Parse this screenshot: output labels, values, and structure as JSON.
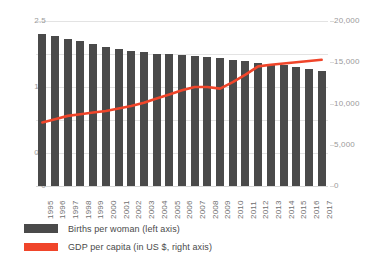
{
  "chart_data": {
    "type": "bar",
    "title": "",
    "subtitle": "",
    "xlabel": "",
    "ylabel": "",
    "grid": true,
    "legend_position": "bottom-left",
    "categories": [
      "1995",
      "1996",
      "1997",
      "1998",
      "1999",
      "2000",
      "2001",
      "2002",
      "2003",
      "2004",
      "2005",
      "2006",
      "2007",
      "2008",
      "2009",
      "2010",
      "2011",
      "2012",
      "2013",
      "2014",
      "2015",
      "2016",
      "2017"
    ],
    "series": [
      {
        "name": "Births per woman (left axis)",
        "type": "bar",
        "axis": "left",
        "color": "#4a4a4a",
        "values": [
          2.3,
          2.27,
          2.22,
          2.2,
          2.15,
          2.11,
          2.07,
          2.05,
          2.03,
          2.0,
          2.0,
          1.99,
          1.97,
          1.96,
          1.94,
          1.91,
          1.89,
          1.86,
          1.85,
          1.84,
          1.8,
          1.78,
          1.75
        ]
      },
      {
        "name": "GDP per capita (in US $, right axis)",
        "type": "line",
        "axis": "right",
        "color": "#f0452a",
        "values": [
          7700,
          8100,
          8500,
          8700,
          8900,
          9100,
          9400,
          9700,
          10100,
          10600,
          11100,
          11600,
          12000,
          12000,
          11800,
          12600,
          13500,
          14500,
          14700,
          14850,
          15000,
          15150,
          15300
        ]
      }
    ],
    "left_axis": {
      "min": 0,
      "max": 2.5,
      "ticks": [
        0,
        0.5,
        1,
        1.5,
        2,
        2.5
      ],
      "tick_labels": [
        "0",
        "0.5",
        "1",
        "1.5",
        "2",
        "2.5"
      ]
    },
    "right_axis": {
      "min": 0,
      "max": 20000,
      "ticks": [
        0,
        5000,
        10000,
        15000,
        20000
      ],
      "tick_labels": [
        "0",
        "5,000",
        "10,000",
        "15,000",
        "20,000"
      ]
    }
  },
  "legend": {
    "items": [
      {
        "label": "Births per woman (left axis)",
        "color": "#4a4a4a",
        "shape": "bar-swatch"
      },
      {
        "label": "GDP per capita (in US $, right axis)",
        "color": "#f0452a",
        "shape": "line-swatch"
      }
    ]
  },
  "colors": {
    "bar": "#4a4a4a",
    "line": "#f0452a",
    "grid": "#e3e3e3",
    "axis_text": "#9a9a9a",
    "xlabel_text": "#6f6f6f",
    "legend_text": "#4a4a4a",
    "background": "#ffffff"
  }
}
